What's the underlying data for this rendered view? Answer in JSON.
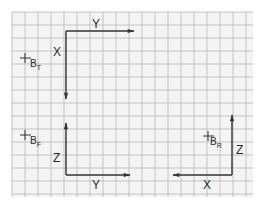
{
  "diagram": {
    "type": "coordinate-axes-views",
    "background": "#ffffff",
    "grid": {
      "color": "#b8b8b8",
      "paper": "#f4f4f4",
      "x0": 12,
      "y0": 12,
      "x1": 253,
      "y1": 197,
      "cell": 13
    },
    "line_color": "#333333",
    "views": [
      {
        "id": "top",
        "marker_label": "B",
        "marker_sub": "T",
        "horizontal_axis": "Y",
        "vertical_axis": "X",
        "horizontal_direction": "right",
        "vertical_direction": "down"
      },
      {
        "id": "front",
        "marker_label": "B",
        "marker_sub": "F",
        "horizontal_axis": "Y",
        "vertical_axis": "Z",
        "horizontal_direction": "right",
        "vertical_direction": "up"
      },
      {
        "id": "right",
        "marker_label": "B",
        "marker_sub": "R",
        "horizontal_axis": "X",
        "vertical_axis": "Z",
        "horizontal_direction": "left",
        "vertical_direction": "up"
      }
    ]
  }
}
